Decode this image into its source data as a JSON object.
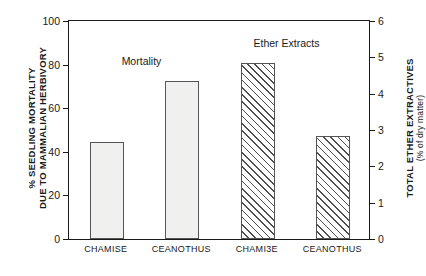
{
  "chart_data": {
    "type": "bar",
    "title": "",
    "categories": [
      "CHAMISE",
      "CEANOTHUS",
      "CHAMI3E",
      "CEANOTHUS"
    ],
    "series": [
      {
        "name": "Mortality",
        "axis": "left",
        "style": "solid",
        "values": [
          44,
          72,
          null,
          null
        ]
      },
      {
        "name": "Ether Extracts",
        "axis": "right",
        "style": "hatched",
        "values": [
          null,
          null,
          4.8,
          2.8
        ]
      }
    ],
    "left_axis": {
      "label_line1": "% SEEDLING MORTALITY",
      "label_line2": "DUE TO MAMMALIAN HERBIVORY",
      "ticks": [
        0,
        20,
        40,
        60,
        80,
        100
      ],
      "ylim": [
        0,
        100
      ]
    },
    "right_axis": {
      "label_line1": "TOTAL ETHER EXTRACTIVES",
      "label_line2": "(% of dry matter)",
      "ticks": [
        0,
        1,
        2,
        3,
        4,
        5,
        6
      ],
      "ylim": [
        0,
        6
      ]
    },
    "annotations": [
      {
        "text": "Mortality",
        "x": 0.24,
        "y": 0.82
      },
      {
        "text": "Ether Extracts",
        "x": 0.72,
        "y": 0.9
      }
    ],
    "grid": false,
    "legend": "none"
  },
  "axis_labels": {
    "left_line1": "% SEEDLING MORTALITY",
    "left_line2": "DUE TO MAMMALIAN HERBIVORY",
    "right_line1": "TOTAL ETHER EXTRACTIVES",
    "right_line2": "(% of dry matter)"
  },
  "left_ticks": {
    "t0": "0",
    "t1": "20",
    "t2": "40",
    "t3": "60",
    "t4": "80",
    "t5": "100"
  },
  "right_ticks": {
    "t0": "0",
    "t1": "1",
    "t2": "2",
    "t3": "3",
    "t4": "4",
    "t5": "5",
    "t6": "6"
  },
  "categories": {
    "c0": "CHAMISE",
    "c1": "CEANOTHUS",
    "c2": "CHAMI3E",
    "c3": "CEANOTHUS"
  },
  "annotations": {
    "mortality": "Mortality",
    "ether": "Ether Extracts"
  }
}
